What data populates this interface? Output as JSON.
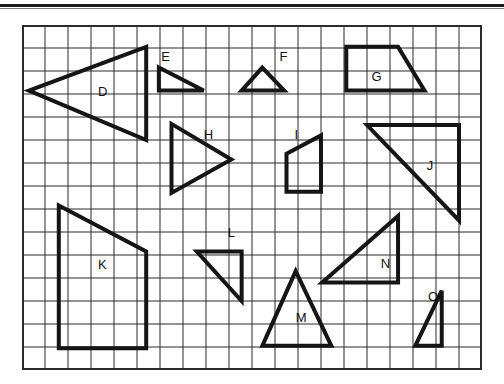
{
  "page": {
    "background_color": "#ffffff",
    "rule_color": "#1a1a1a"
  },
  "grid": {
    "name": "square-grid",
    "origin_x": 22,
    "origin_y": 25,
    "cell_size": 23,
    "columns": 20,
    "rows": 15,
    "line_color": "#2b2b2b",
    "line_width": 1,
    "border_width": 2
  },
  "style": {
    "shape_stroke_color": "#151515",
    "shape_stroke_width": 4,
    "label_color": "#111111",
    "label_font_size": 13
  },
  "shapes": [
    {
      "id": "D",
      "label": "D",
      "type": "triangle",
      "label_x": 3.3,
      "label_y": 3.1,
      "points_cells": [
        [
          0.3,
          2.85
        ],
        [
          5.4,
          0.95
        ],
        [
          5.4,
          5.0
        ]
      ],
      "closed": true
    },
    {
      "id": "E",
      "label": "E",
      "type": "right-triangle",
      "label_x": 6.05,
      "label_y": 1.55,
      "points_cells": [
        [
          5.95,
          1.85
        ],
        [
          7.9,
          2.85
        ],
        [
          5.95,
          2.85
        ]
      ],
      "closed": true
    },
    {
      "id": "F",
      "label": "F",
      "type": "triangle",
      "label_x": 11.2,
      "label_y": 1.55,
      "points_cells": [
        [
          10.45,
          1.85
        ],
        [
          11.4,
          2.85
        ],
        [
          9.55,
          2.85
        ]
      ],
      "closed": true
    },
    {
      "id": "G",
      "label": "G",
      "type": "trapezoid",
      "label_x": 15.2,
      "label_y": 2.45,
      "points_cells": [
        [
          14.1,
          0.95
        ],
        [
          16.35,
          0.95
        ],
        [
          17.5,
          2.85
        ],
        [
          14.1,
          2.85
        ]
      ],
      "closed": true
    },
    {
      "id": "H",
      "label": "H",
      "type": "triangle",
      "label_x": 7.9,
      "label_y": 4.95,
      "points_cells": [
        [
          6.5,
          4.3
        ],
        [
          9.1,
          5.85
        ],
        [
          6.5,
          7.3
        ]
      ],
      "closed": true
    },
    {
      "id": "I",
      "label": "I",
      "type": "quadrilateral",
      "label_x": 11.85,
      "label_y": 4.95,
      "points_cells": [
        [
          11.5,
          5.6
        ],
        [
          13.0,
          4.8
        ],
        [
          13.0,
          7.25
        ],
        [
          11.5,
          7.25
        ]
      ],
      "closed": true
    },
    {
      "id": "J",
      "label": "J",
      "type": "right-triangle",
      "label_x": 17.6,
      "label_y": 6.3,
      "points_cells": [
        [
          15.0,
          4.35
        ],
        [
          19.0,
          4.35
        ],
        [
          19.0,
          8.5
        ]
      ],
      "closed": true
    },
    {
      "id": "K",
      "label": "K",
      "type": "quadrilateral",
      "label_x": 3.3,
      "label_y": 10.6,
      "points_cells": [
        [
          1.6,
          7.85
        ],
        [
          5.4,
          9.85
        ],
        [
          5.4,
          14.05
        ],
        [
          1.6,
          14.05
        ]
      ],
      "closed": true
    },
    {
      "id": "L",
      "label": "L",
      "type": "right-triangle",
      "label_x": 8.95,
      "label_y": 9.2,
      "points_cells": [
        [
          7.6,
          9.85
        ],
        [
          9.55,
          9.85
        ],
        [
          9.55,
          12.0
        ]
      ],
      "closed": true
    },
    {
      "id": "M",
      "label": "M",
      "type": "triangle",
      "label_x": 11.9,
      "label_y": 12.9,
      "points_cells": [
        [
          11.9,
          10.7
        ],
        [
          13.45,
          13.95
        ],
        [
          10.45,
          13.95
        ]
      ],
      "closed": true
    },
    {
      "id": "N",
      "label": "N",
      "type": "right-triangle",
      "label_x": 15.6,
      "label_y": 10.55,
      "points_cells": [
        [
          16.35,
          8.3
        ],
        [
          16.35,
          11.2
        ],
        [
          13.05,
          11.2
        ]
      ],
      "closed": true
    },
    {
      "id": "O",
      "label": "O",
      "type": "narrow-triangle",
      "label_x": 17.65,
      "label_y": 12.0,
      "points_cells": [
        [
          18.25,
          11.55
        ],
        [
          18.25,
          13.95
        ],
        [
          17.1,
          13.95
        ]
      ],
      "closed": true
    }
  ]
}
